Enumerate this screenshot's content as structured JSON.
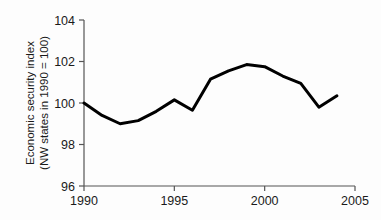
{
  "chart_data": {
    "type": "line",
    "title": "",
    "subtitle": "",
    "xlabel": "",
    "ylabel": "Economic security index",
    "ylabel_line2": "(NW states in 1990 = 100)",
    "x": [
      1990,
      1991,
      1992,
      1993,
      1994,
      1995,
      1996,
      1997,
      1998,
      1999,
      2000,
      2001,
      2002,
      2003,
      2004
    ],
    "values": [
      100.0,
      99.4,
      99.0,
      99.15,
      99.6,
      100.15,
      99.65,
      101.15,
      101.55,
      101.85,
      101.75,
      101.3,
      100.95,
      99.8,
      100.35
    ],
    "series": [
      {
        "name": "Economic security index",
        "values": [
          100.0,
          99.4,
          99.0,
          99.15,
          99.6,
          100.15,
          99.65,
          101.15,
          101.55,
          101.85,
          101.75,
          101.3,
          100.95,
          99.8,
          100.35
        ],
        "color": "#000000"
      }
    ],
    "xlim": [
      1990,
      2005
    ],
    "ylim": [
      96,
      104
    ],
    "xticks": [
      1990,
      1995,
      2000,
      2005
    ],
    "xtick_labels": [
      "1990",
      "1995",
      "2000",
      "2005"
    ],
    "yticks": [
      96,
      98,
      100,
      102,
      104
    ],
    "ytick_labels": [
      "96",
      "98",
      "100",
      "102",
      "104"
    ],
    "grid": false,
    "legend": false,
    "legend_position": "none",
    "line_width": 3,
    "axis_color": "#555555",
    "background_color": "#fdfdfd"
  }
}
